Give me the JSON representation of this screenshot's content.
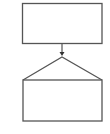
{
  "diagram": {
    "stroke_color": "#555555",
    "background": "#ffffff",
    "top_box": {
      "x": 22.5,
      "y": 3.5,
      "width": 79.5,
      "height": 40,
      "label": ""
    },
    "connector": {
      "x": 62,
      "y1": 43.5,
      "y2": 56,
      "arrow_head": "triangle-down"
    },
    "roof": {
      "apex_x": 62,
      "apex_y": 57,
      "left_x": 23,
      "right_x": 102,
      "base_y": 80
    },
    "bottom_box": {
      "x": 23,
      "y": 80,
      "width": 79,
      "height": 41,
      "label": ""
    }
  }
}
